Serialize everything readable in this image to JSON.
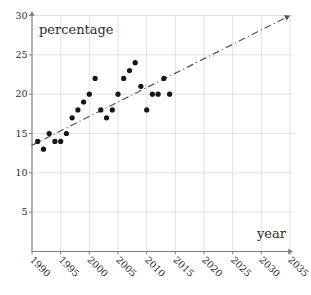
{
  "figure": {
    "width": 311,
    "height": 295,
    "background": "#ffffff"
  },
  "chart_data": {
    "type": "scatter",
    "title": "",
    "xlabel": "year",
    "ylabel": "percentage",
    "xlim": [
      1990,
      2037
    ],
    "ylim": [
      0,
      30
    ],
    "grid": true,
    "x_ticks": [
      1990,
      1995,
      2000,
      2005,
      2010,
      2015,
      2020,
      2025,
      2030,
      2035
    ],
    "y_ticks": [
      5,
      10,
      15,
      20,
      25,
      30
    ],
    "points": [
      {
        "year": 1991,
        "value": 14
      },
      {
        "year": 1992,
        "value": 13
      },
      {
        "year": 1993,
        "value": 15
      },
      {
        "year": 1994,
        "value": 14
      },
      {
        "year": 1995,
        "value": 14
      },
      {
        "year": 1996,
        "value": 15
      },
      {
        "year": 1997,
        "value": 17
      },
      {
        "year": 1998,
        "value": 18
      },
      {
        "year": 1999,
        "value": 19
      },
      {
        "year": 2000,
        "value": 20
      },
      {
        "year": 2001,
        "value": 22
      },
      {
        "year": 2002,
        "value": 18
      },
      {
        "year": 2003,
        "value": 17
      },
      {
        "year": 2004,
        "value": 18
      },
      {
        "year": 2005,
        "value": 20
      },
      {
        "year": 2006,
        "value": 22
      },
      {
        "year": 2007,
        "value": 23
      },
      {
        "year": 2008,
        "value": 24
      },
      {
        "year": 2009,
        "value": 21
      },
      {
        "year": 2010,
        "value": 18
      },
      {
        "year": 2011,
        "value": 20
      },
      {
        "year": 2012,
        "value": 20
      },
      {
        "year": 2013,
        "value": 22
      },
      {
        "year": 2014,
        "value": 20
      }
    ],
    "trend_line": {
      "style": "dash-dot",
      "from": {
        "year": 1990,
        "value": 13.5
      },
      "to": {
        "year": 2035,
        "value": 30
      },
      "arrow": true
    },
    "colors": {
      "point": "#161616",
      "trend": "#4f4f4f",
      "grid": "#d9d9d9",
      "axis": "#7f7f7f",
      "text": "#2b2b2b"
    }
  }
}
